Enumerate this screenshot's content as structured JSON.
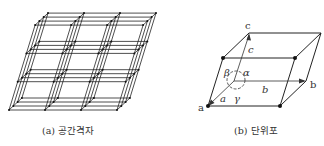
{
  "figures": {
    "space_lattice": {
      "caption": "(a) 공간격자",
      "grid": {
        "origin": [
          9,
          110
        ],
        "b_step": [
          36,
          0
        ],
        "c_step": [
          8.7,
          -28.3
        ],
        "d_step": [
          4.3,
          -4
        ],
        "nb": 3,
        "nc": 3,
        "nd": 3
      }
    },
    "unit_cell": {
      "caption": "(b) 단위포",
      "corner_labels": {
        "a": "a",
        "b": "b",
        "c": "c"
      },
      "edge_labels": {
        "a": "a",
        "b": "b",
        "c": "c"
      },
      "angle_labels": {
        "alpha": "α",
        "beta": "β",
        "gamma": "γ"
      }
    }
  },
  "colors": {
    "line": "#222222",
    "text": "#333333"
  }
}
